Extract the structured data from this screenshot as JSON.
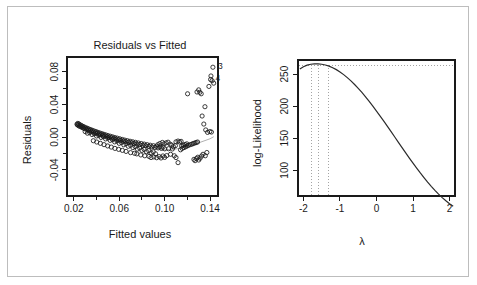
{
  "figure": {
    "background_color": "#ffffff",
    "frame_color": "#bdbdbd",
    "axis_color": "#1a1a1a",
    "point_color": "#1a1a1a",
    "smoother_color": "#b0b0b0",
    "dotted_color": "#9a9a9a"
  },
  "chart_data": [
    {
      "type": "scatter",
      "panel": "left",
      "title": "Residuals vs Fitted",
      "xlabel": "Fitted values",
      "ylabel": "Residuals",
      "xlim": [
        0.014,
        0.147
      ],
      "ylim": [
        -0.072,
        0.098
      ],
      "grid": false,
      "legend": null,
      "xticks": [
        0.02,
        0.06,
        0.1,
        0.14
      ],
      "xtick_labels": [
        "0.02",
        "0.06",
        "0.10",
        "0.14"
      ],
      "xticks_minor": [
        0.04,
        0.08,
        0.12
      ],
      "yticks": [
        -0.04,
        0.0,
        0.04,
        0.08
      ],
      "ytick_labels": [
        "-0.04",
        "0.00",
        "0.04",
        "0.08"
      ],
      "yticks_minor": [
        -0.02,
        0.02,
        0.06
      ],
      "marker": "open-circle",
      "point_labels": [
        {
          "label": "3",
          "x": 0.1425,
          "y": 0.0855
        },
        {
          "label": "4",
          "x": 0.1405,
          "y": 0.0705
        }
      ],
      "points": [
        [
          0.0228,
          0.0158
        ],
        [
          0.0232,
          0.015
        ],
        [
          0.0236,
          0.0168
        ],
        [
          0.0241,
          0.0142
        ],
        [
          0.0245,
          0.016
        ],
        [
          0.025,
          0.0133
        ],
        [
          0.0256,
          0.015
        ],
        [
          0.0262,
          0.0128
        ],
        [
          0.0268,
          0.0141
        ],
        [
          0.0273,
          0.0118
        ],
        [
          0.0279,
          0.0132
        ],
        [
          0.0285,
          0.011
        ],
        [
          0.0292,
          0.0124
        ],
        [
          0.0298,
          0.0102
        ],
        [
          0.0305,
          0.0115
        ],
        [
          0.0312,
          0.0096
        ],
        [
          0.0319,
          0.0108
        ],
        [
          0.0326,
          0.0086
        ],
        [
          0.0333,
          0.0099
        ],
        [
          0.034,
          0.0078
        ],
        [
          0.0348,
          0.0092
        ],
        [
          0.0355,
          0.007
        ],
        [
          0.0363,
          0.0083
        ],
        [
          0.0371,
          0.0062
        ],
        [
          0.0379,
          0.0075
        ],
        [
          0.0387,
          0.0054
        ],
        [
          0.0395,
          0.0068
        ],
        [
          0.0403,
          0.0046
        ],
        [
          0.0411,
          0.0059
        ],
        [
          0.042,
          0.0038
        ],
        [
          0.0428,
          0.0051
        ],
        [
          0.0437,
          0.003
        ],
        [
          0.0446,
          0.0043
        ],
        [
          0.0455,
          0.0022
        ],
        [
          0.0464,
          0.0035
        ],
        [
          0.0473,
          0.0014
        ],
        [
          0.0482,
          0.0027
        ],
        [
          0.0492,
          0.0006
        ],
        [
          0.0501,
          0.0019
        ],
        [
          0.0511,
          -0.0002
        ],
        [
          0.0521,
          0.0011
        ],
        [
          0.0531,
          -0.001
        ],
        [
          0.0541,
          0.0003
        ],
        [
          0.0551,
          -0.0018
        ],
        [
          0.0561,
          -0.0005
        ],
        [
          0.0572,
          -0.0026
        ],
        [
          0.0582,
          -0.0012
        ],
        [
          0.0593,
          -0.0033
        ],
        [
          0.0604,
          -0.002
        ],
        [
          0.0615,
          -0.0041
        ],
        [
          0.0626,
          -0.0028
        ],
        [
          0.0637,
          -0.0049
        ],
        [
          0.0648,
          -0.0036
        ],
        [
          0.066,
          -0.0056
        ],
        [
          0.0671,
          -0.0043
        ],
        [
          0.0683,
          -0.0063
        ],
        [
          0.0695,
          -0.005
        ],
        [
          0.0707,
          -0.007
        ],
        [
          0.0719,
          -0.0057
        ],
        [
          0.0731,
          -0.0078
        ],
        [
          0.0743,
          -0.0064
        ],
        [
          0.0756,
          -0.0085
        ],
        [
          0.0768,
          -0.0071
        ],
        [
          0.0781,
          -0.0092
        ],
        [
          0.0794,
          -0.0078
        ],
        [
          0.0807,
          -0.0099
        ],
        [
          0.082,
          -0.0085
        ],
        [
          0.0833,
          -0.0106
        ],
        [
          0.0846,
          -0.0092
        ],
        [
          0.086,
          -0.0113
        ],
        [
          0.0873,
          -0.0099
        ],
        [
          0.0887,
          -0.012
        ],
        [
          0.0901,
          -0.0105
        ],
        [
          0.0915,
          -0.0126
        ],
        [
          0.0929,
          -0.0111
        ],
        [
          0.0943,
          -0.0132
        ],
        [
          0.0957,
          -0.0117
        ],
        [
          0.0972,
          -0.0138
        ],
        [
          0.0986,
          -0.0122
        ],
        [
          0.1001,
          -0.0143
        ],
        [
          0.03,
          0.0068
        ],
        [
          0.034,
          0.0055
        ],
        [
          0.038,
          0.004
        ],
        [
          0.042,
          0.0022
        ],
        [
          0.046,
          0.0006
        ],
        [
          0.05,
          -0.0012
        ],
        [
          0.054,
          -0.003
        ],
        [
          0.058,
          -0.0048
        ],
        [
          0.062,
          -0.0066
        ],
        [
          0.066,
          -0.0082
        ],
        [
          0.07,
          -0.01
        ],
        [
          0.074,
          -0.0116
        ],
        [
          0.078,
          -0.0134
        ],
        [
          0.082,
          -0.015
        ],
        [
          0.086,
          -0.0166
        ],
        [
          0.09,
          -0.018
        ],
        [
          0.032,
          0.0048
        ],
        [
          0.036,
          0.0032
        ],
        [
          0.04,
          0.0014
        ],
        [
          0.044,
          -0.0004
        ],
        [
          0.048,
          -0.0022
        ],
        [
          0.052,
          -0.004
        ],
        [
          0.056,
          -0.0058
        ],
        [
          0.06,
          -0.0076
        ],
        [
          0.064,
          -0.0094
        ],
        [
          0.068,
          -0.0112
        ],
        [
          0.072,
          -0.0128
        ],
        [
          0.076,
          -0.0146
        ],
        [
          0.08,
          -0.0162
        ],
        [
          0.084,
          -0.0178
        ],
        [
          0.088,
          -0.0192
        ],
        [
          0.092,
          -0.0204
        ],
        [
          0.0755,
          -0.0205
        ],
        [
          0.079,
          -0.0218
        ],
        [
          0.0825,
          -0.0228
        ],
        [
          0.0862,
          -0.0236
        ],
        [
          0.088,
          -0.025
        ],
        [
          0.0905,
          -0.0242
        ],
        [
          0.093,
          -0.0252
        ],
        [
          0.0952,
          -0.0238
        ],
        [
          0.0968,
          -0.0255
        ],
        [
          0.0985,
          -0.023
        ],
        [
          0.1,
          -0.0248
        ],
        [
          0.1018,
          -0.0226
        ],
        [
          0.07,
          -0.019
        ],
        [
          0.0735,
          -0.0198
        ],
        [
          0.066,
          -0.0175
        ],
        [
          0.0628,
          -0.0162
        ],
        [
          0.0595,
          -0.015
        ],
        [
          0.0562,
          -0.0138
        ],
        [
          0.053,
          -0.0122
        ],
        [
          0.0498,
          -0.0108
        ],
        [
          0.0466,
          -0.0092
        ],
        [
          0.0434,
          -0.0076
        ],
        [
          0.0402,
          -0.006
        ],
        [
          0.0372,
          -0.0044
        ],
        [
          0.1035,
          -0.0142
        ],
        [
          0.1052,
          -0.021
        ],
        [
          0.1068,
          -0.0145
        ],
        [
          0.1085,
          -0.0228
        ],
        [
          0.1012,
          -0.007
        ],
        [
          0.103,
          -0.0062
        ],
        [
          0.1048,
          -0.0086
        ],
        [
          0.1062,
          -0.0098
        ],
        [
          0.098,
          -0.0065
        ],
        [
          0.0995,
          -0.0082
        ],
        [
          0.0958,
          -0.0078
        ],
        [
          0.094,
          -0.0092
        ],
        [
          0.1078,
          -0.0118
        ],
        [
          0.1095,
          -0.0104
        ],
        [
          0.11,
          -0.025
        ],
        [
          0.1118,
          -0.0312
        ],
        [
          0.114,
          -0.0155
        ],
        [
          0.1155,
          -0.0138
        ],
        [
          0.117,
          -0.0128
        ],
        [
          0.1185,
          -0.0118
        ],
        [
          0.1198,
          -0.0108
        ],
        [
          0.121,
          -0.01
        ],
        [
          0.1225,
          -0.0092
        ],
        [
          0.124,
          -0.0086
        ],
        [
          0.115,
          -0.0108
        ],
        [
          0.1165,
          -0.0098
        ],
        [
          0.118,
          -0.009
        ],
        [
          0.1195,
          -0.0082
        ],
        [
          0.1252,
          -0.0078
        ],
        [
          0.1266,
          -0.0072
        ],
        [
          0.1278,
          -0.0066
        ],
        [
          0.129,
          -0.006
        ],
        [
          0.1258,
          -0.0272
        ],
        [
          0.1268,
          -0.0288
        ],
        [
          0.128,
          -0.0262
        ],
        [
          0.1292,
          -0.0246
        ],
        [
          0.13,
          -0.028
        ],
        [
          0.1312,
          -0.0258
        ],
        [
          0.1325,
          -0.0232
        ],
        [
          0.1338,
          -0.021
        ],
        [
          0.1202,
          0.053
        ],
        [
          0.1285,
          0.0552
        ],
        [
          0.13,
          0.0578
        ],
        [
          0.131,
          0.0548
        ],
        [
          0.1322,
          0.053
        ],
        [
          0.1355,
          0.0372
        ],
        [
          0.133,
          0.0258
        ],
        [
          0.1345,
          0.016
        ],
        [
          0.1362,
          0.0088
        ],
        [
          0.1378,
          0.0058
        ],
        [
          0.1398,
          0.0068
        ],
        [
          0.1412,
          0.0062
        ],
        [
          0.1425,
          0.0855
        ],
        [
          0.1408,
          0.0748
        ],
        [
          0.1405,
          0.0705
        ],
        [
          0.1418,
          0.069
        ],
        [
          0.1432,
          0.066
        ],
        [
          0.139,
          0.062
        ],
        [
          0.1372,
          -0.0188
        ],
        [
          0.1358,
          -0.0228
        ],
        [
          0.11,
          -0.0058
        ],
        [
          0.1118,
          -0.0048
        ],
        [
          0.1132,
          -0.006
        ],
        [
          0.1145,
          -0.0052
        ]
      ],
      "smoother": {
        "name": "loess",
        "points": [
          [
            0.0228,
            0.015
          ],
          [
            0.04,
            0.005
          ],
          [
            0.056,
            -0.003
          ],
          [
            0.072,
            -0.0095
          ],
          [
            0.088,
            -0.014
          ],
          [
            0.1,
            -0.0155
          ],
          [
            0.11,
            -0.0145
          ],
          [
            0.12,
            -0.0115
          ],
          [
            0.13,
            -0.007
          ],
          [
            0.14,
            -0.002
          ],
          [
            0.1432,
            0.0005
          ]
        ]
      }
    },
    {
      "type": "line",
      "panel": "right",
      "title": "",
      "xlabel": "λ",
      "ylabel": "log-Likelihood",
      "xlim": [
        -2.15,
        2.15
      ],
      "ylim": [
        60,
        272
      ],
      "grid": false,
      "legend": null,
      "xticks": [
        -2,
        -1,
        0,
        1,
        2
      ],
      "xtick_labels": [
        "-2",
        "-1",
        "0",
        "1",
        "2"
      ],
      "yticks": [
        100,
        150,
        200,
        250
      ],
      "ytick_labels": [
        "100",
        "150",
        "200",
        "250"
      ],
      "ci_level_label": "95%",
      "ci_horizontal_y": 263.5,
      "ci_vertical_x": [
        -1.78,
        -1.58,
        -1.32
      ],
      "max_loglik": 266.0,
      "max_lambda": -1.58,
      "x": [
        -2.1,
        -2.0,
        -1.9,
        -1.8,
        -1.7,
        -1.6,
        -1.5,
        -1.4,
        -1.3,
        -1.2,
        -1.1,
        -1.0,
        -0.9,
        -0.8,
        -0.7,
        -0.6,
        -0.5,
        -0.4,
        -0.3,
        -0.2,
        -0.1,
        0.0,
        0.1,
        0.2,
        0.3,
        0.4,
        0.5,
        0.6,
        0.7,
        0.8,
        0.9,
        1.0,
        1.1,
        1.2,
        1.3,
        1.4,
        1.5,
        1.6,
        1.7,
        1.8,
        1.9,
        2.0,
        2.1
      ],
      "y": [
        258.0,
        261.5,
        264.0,
        265.4,
        266.0,
        266.0,
        265.4,
        264.2,
        262.4,
        260.0,
        257.0,
        253.4,
        249.2,
        244.5,
        239.4,
        233.8,
        227.8,
        221.4,
        214.6,
        207.4,
        200.0,
        192.4,
        184.6,
        176.6,
        168.5,
        160.3,
        152.0,
        143.7,
        135.4,
        127.2,
        119.1,
        111.2,
        103.5,
        96.0,
        88.8,
        81.8,
        75.1,
        68.8,
        62.9,
        57.5,
        52.5,
        48.0,
        44.0
      ]
    }
  ]
}
